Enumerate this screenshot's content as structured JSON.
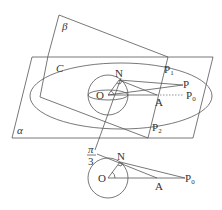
{
  "labels": {
    "beta": "β",
    "alpha": "α",
    "curve": "C",
    "N": "N",
    "O": "O",
    "A": "A",
    "P": "P",
    "P0": "P",
    "P0_sub": "0",
    "P1": "P",
    "P1_sub": "1",
    "P2": "P",
    "P2_sub": "2",
    "angle_num": "π",
    "angle_den": "3"
  },
  "bottom_labels": {
    "N": "N",
    "O": "O",
    "A": "A",
    "P0": "P",
    "P0_sub": "0"
  },
  "colors": {
    "line": "#555555",
    "text": "#333333"
  }
}
